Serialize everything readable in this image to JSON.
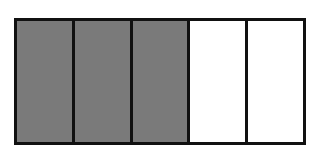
{
  "diagram": {
    "type": "fraction-bar",
    "total_parts": 5,
    "shaded_parts": 3,
    "fraction_shown": "3/5",
    "colors": {
      "shaded": "#7a7a7a",
      "unshaded": "#ffffff",
      "border": "#111111"
    },
    "parts": [
      {
        "index": 1,
        "state": "shaded"
      },
      {
        "index": 2,
        "state": "shaded"
      },
      {
        "index": 3,
        "state": "shaded"
      },
      {
        "index": 4,
        "state": "unshaded"
      },
      {
        "index": 5,
        "state": "unshaded"
      }
    ]
  }
}
